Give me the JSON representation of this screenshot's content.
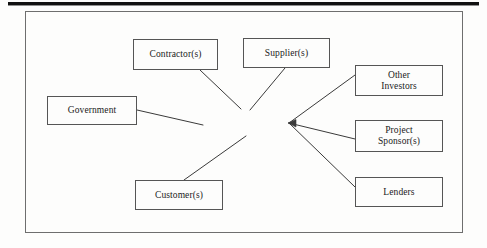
{
  "figure": {
    "frame": {
      "x": 25,
      "y": 11,
      "width": 438,
      "height": 222
    },
    "top_rule": {
      "x": 8,
      "y": 2,
      "width": 471,
      "height": 3,
      "color": "#111111"
    },
    "background_color": "#fdfdfc",
    "box_border_color": "#555555",
    "line_color": "#3a3a3a",
    "text_color": "#1b1b1b"
  },
  "diagram_data": {
    "type": "node-link",
    "hub": {
      "name": "convergence-point",
      "x": 289,
      "y": 123,
      "arrowhead": true
    },
    "nodes": [
      {
        "id": "contractor",
        "label": "Contractor(s)",
        "x": 133,
        "y": 39,
        "width": 85,
        "height": 31,
        "side": "left"
      },
      {
        "id": "supplier",
        "label": "Supplier(s)",
        "x": 243,
        "y": 38,
        "width": 87,
        "height": 30,
        "side": "left"
      },
      {
        "id": "government",
        "label": "Government",
        "x": 47,
        "y": 96,
        "width": 90,
        "height": 29,
        "side": "left"
      },
      {
        "id": "customer",
        "label": "Customer(s)",
        "x": 135,
        "y": 180,
        "width": 88,
        "height": 30,
        "side": "left"
      },
      {
        "id": "other-investors",
        "label": "Other\nInvestors",
        "x": 355,
        "y": 65,
        "width": 88,
        "height": 31,
        "side": "right"
      },
      {
        "id": "project-sponsor",
        "label": "Project\nSponsor(s)",
        "x": 355,
        "y": 120,
        "width": 88,
        "height": 32,
        "side": "right"
      },
      {
        "id": "lenders",
        "label": "Lenders",
        "x": 355,
        "y": 177,
        "width": 88,
        "height": 30,
        "side": "right"
      }
    ],
    "edges": [
      {
        "id": "edge-contractor",
        "from": "contractor",
        "to": "hub",
        "x1": 200,
        "y1": 70,
        "x2": 241,
        "y2": 109,
        "arrow": false
      },
      {
        "id": "edge-supplier",
        "from": "supplier",
        "to": "hub",
        "x1": 285,
        "y1": 68,
        "x2": 250,
        "y2": 110,
        "arrow": false
      },
      {
        "id": "edge-government",
        "from": "government",
        "to": "hub",
        "x1": 137,
        "y1": 110,
        "x2": 203,
        "y2": 125,
        "arrow": false
      },
      {
        "id": "edge-customer",
        "from": "customer",
        "to": "hub",
        "x1": 184,
        "y1": 180,
        "x2": 246,
        "y2": 136,
        "arrow": false
      },
      {
        "id": "edge-other-investors",
        "from": "hub",
        "to": "other-investors",
        "x1": 289,
        "y1": 123,
        "x2": 355,
        "y2": 75,
        "arrow": true
      },
      {
        "id": "edge-project-sponsor",
        "from": "hub",
        "to": "project-sponsor",
        "x1": 289,
        "y1": 123,
        "x2": 355,
        "y2": 139,
        "arrow": true
      },
      {
        "id": "edge-lenders",
        "from": "hub",
        "to": "lenders",
        "x1": 289,
        "y1": 123,
        "x2": 355,
        "y2": 187,
        "arrow": true
      }
    ]
  }
}
